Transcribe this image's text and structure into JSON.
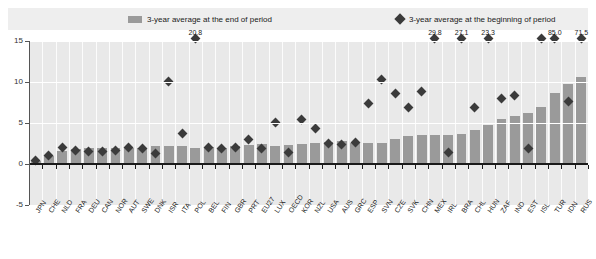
{
  "legend": {
    "bar_label": "3-year average at the end of period",
    "diamond_label": "3-year average at the beginning of period",
    "bar_color": "#9a9a9a",
    "diamond_color": "#3b3b3b"
  },
  "chart_data": {
    "type": "bar",
    "title": "",
    "xlabel": "",
    "ylabel": "",
    "ylim": [
      -5,
      15
    ],
    "yticks": [
      -5,
      0,
      5,
      10,
      15
    ],
    "grid": true,
    "legend_position": "top",
    "categories": [
      "JPN",
      "CHE",
      "NLD",
      "FRA",
      "DEU",
      "CAN",
      "NOR",
      "AUT",
      "SWE",
      "DNK",
      "ISR",
      "ITA",
      "POL",
      "BEL",
      "FIN",
      "GBR",
      "PRT",
      "EU27",
      "LUX",
      "OECD",
      "KOR",
      "NZL",
      "USA",
      "AUS",
      "GRC",
      "ESP",
      "SVN",
      "CZE",
      "SVK",
      "CHN",
      "MEX",
      "IRL",
      "BRA",
      "CHL",
      "HUN",
      "ZAF",
      "IND",
      "EST",
      "ISL",
      "TUR",
      "IDN",
      "RUS"
    ],
    "series": [
      {
        "name": "3-year average at the end of period",
        "type": "bar",
        "values": [
          0.4,
          1.0,
          1.6,
          1.8,
          1.9,
          1.9,
          2.0,
          1.9,
          2.0,
          2.2,
          2.2,
          2.2,
          2.0,
          2.1,
          2.0,
          2.2,
          2.3,
          2.4,
          2.2,
          2.3,
          2.5,
          2.6,
          2.7,
          2.8,
          2.6,
          2.6,
          2.6,
          3.1,
          3.4,
          3.5,
          3.5,
          3.5,
          3.6,
          4.2,
          4.7,
          5.5,
          5.8,
          6.2,
          6.9,
          8.6,
          9.7,
          10.6
        ]
      },
      {
        "name": "3-year average at the beginning of period",
        "type": "scatter",
        "values": [
          0.5,
          1.1,
          2.1,
          1.7,
          1.6,
          1.6,
          1.7,
          2.1,
          2.0,
          1.3,
          10.1,
          3.8,
          20.8,
          2.1,
          1.9,
          2.1,
          3.0,
          2.0,
          5.1,
          1.5,
          5.5,
          4.4,
          2.6,
          2.5,
          2.7,
          7.4,
          10.4,
          8.6,
          6.9,
          8.9,
          29.8,
          1.5,
          27.1,
          7.0,
          23.3,
          8.0,
          8.4,
          1.9,
          29.8,
          85.0,
          7.7,
          71.5
        ]
      }
    ],
    "point_labels": [
      {
        "category": "POL",
        "value": 20.8,
        "text": "20.8"
      },
      {
        "category": "MEX",
        "value": 29.8,
        "text": "29.8"
      },
      {
        "category": "BRA",
        "value": 27.1,
        "text": "27.1"
      },
      {
        "category": "HUN",
        "value": 23.3,
        "text": "23.3"
      },
      {
        "category": "TUR",
        "value": 85.0,
        "text": "85.0"
      },
      {
        "category": "RUS",
        "value": 71.5,
        "text": "71.5"
      }
    ]
  }
}
